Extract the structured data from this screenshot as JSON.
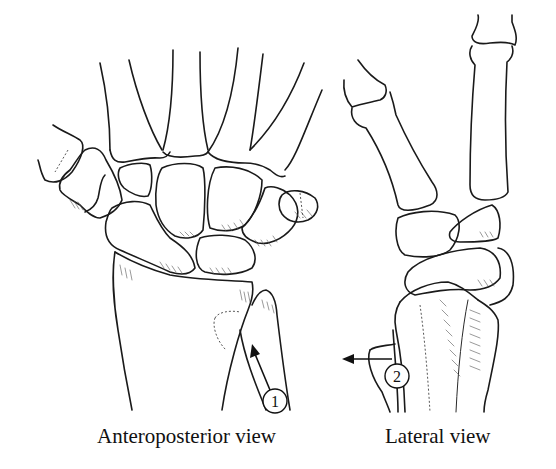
{
  "figure": {
    "views": [
      {
        "id": "anteroposterior",
        "caption": "Anteroposterior view",
        "marker": {
          "label": "1",
          "arrow_direction": "up-left"
        }
      },
      {
        "id": "lateral",
        "caption": "Lateral view",
        "marker": {
          "label": "2",
          "arrow_direction": "left"
        }
      }
    ],
    "colors": {
      "line": "#1a1a1a",
      "background": "#ffffff"
    }
  }
}
